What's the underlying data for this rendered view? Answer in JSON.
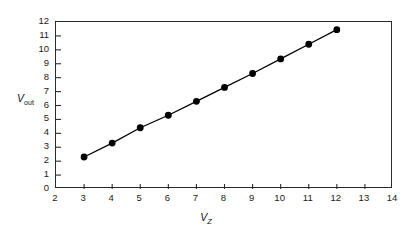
{
  "chart_data": {
    "type": "line",
    "title": "",
    "xlabel": "V_Z",
    "ylabel": "V_out",
    "xlabel_base": "V",
    "xlabel_sub": "Z",
    "ylabel_base": "V",
    "ylabel_sub": "out",
    "xlim": [
      2,
      14
    ],
    "ylim": [
      0,
      12
    ],
    "xticks": [
      2,
      3,
      4,
      5,
      6,
      7,
      8,
      9,
      10,
      11,
      12,
      13,
      14
    ],
    "yticks": [
      0,
      1,
      2,
      3,
      4,
      5,
      6,
      7,
      8,
      9,
      10,
      11,
      12
    ],
    "xtick_labels": [
      "2",
      "3",
      "4",
      "5",
      "6",
      "7",
      "8",
      "9",
      "10",
      "11",
      "12",
      "13",
      "14"
    ],
    "ytick_labels": [
      "0",
      "1",
      "2",
      "3",
      "4",
      "5",
      "6",
      "7",
      "8",
      "9",
      "10",
      "11",
      "12"
    ],
    "grid": false,
    "legend": null,
    "marker": "filled-circle",
    "marker_color": "#000000",
    "line_color": "#000000",
    "x": [
      3,
      4,
      5,
      6,
      7,
      8,
      9,
      10,
      11,
      12
    ],
    "values": [
      2.3,
      3.3,
      4.4,
      5.3,
      6.3,
      7.3,
      8.3,
      9.35,
      10.4,
      11.45
    ],
    "series": [
      {
        "name": "V_out vs V_Z",
        "x": [
          3,
          4,
          5,
          6,
          7,
          8,
          9,
          10,
          11,
          12
        ],
        "values": [
          2.3,
          3.3,
          4.4,
          5.3,
          6.3,
          7.3,
          8.3,
          9.35,
          10.4,
          11.45
        ]
      }
    ]
  },
  "figure": {
    "background_color": "#ffffff",
    "frame_color": "#2b2b2b"
  }
}
